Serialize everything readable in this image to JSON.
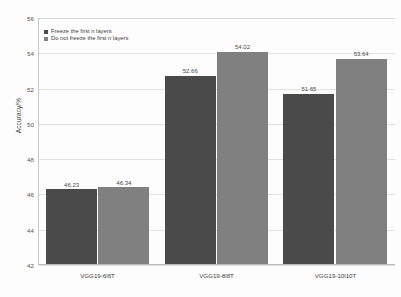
{
  "chart_data": {
    "type": "bar",
    "title": "",
    "xlabel": "",
    "ylabel": "Accuracy/%",
    "ylim": [
      42,
      56
    ],
    "yticks": [
      42,
      44,
      46,
      48,
      50,
      52,
      54,
      56
    ],
    "grid": true,
    "legend_position": "top-left",
    "categories": [
      "VGG19-6l6T",
      "VGG19-8l8T",
      "VGG19-10l10T"
    ],
    "series": [
      {
        "name": "Freeze the first n layers",
        "color": "#4a4a4a",
        "values": [
          46.23,
          52.66,
          51.65
        ],
        "labels": [
          "46.23",
          "52.66",
          "51.65"
        ]
      },
      {
        "name": "Do not freeze the first n layers",
        "color": "#808080",
        "values": [
          46.34,
          54.02,
          53.64
        ],
        "labels": [
          "46.34",
          "54.02",
          "53.64"
        ]
      }
    ]
  },
  "axis": {
    "y_title": "Accuracy/%",
    "y_tick_labels": [
      "56",
      "54",
      "52",
      "50",
      "48",
      "46",
      "44",
      "42"
    ],
    "x_tick_labels": [
      "VGG19-6l6T",
      "VGG19-8l8T",
      "VGG19-10l10T"
    ]
  },
  "legend": {
    "items": [
      {
        "label": "Freeze the first n layers",
        "color": "#4a4a4a"
      },
      {
        "label": "Do not freeze the first n layers",
        "color": "#808080"
      }
    ]
  },
  "colors": {
    "series_1": "#4a4a4a",
    "series_2": "#808080",
    "gridline": "#e2e2e2",
    "axis": "#b8b8b8",
    "background": "#fdfdfd",
    "text": "#444444"
  }
}
